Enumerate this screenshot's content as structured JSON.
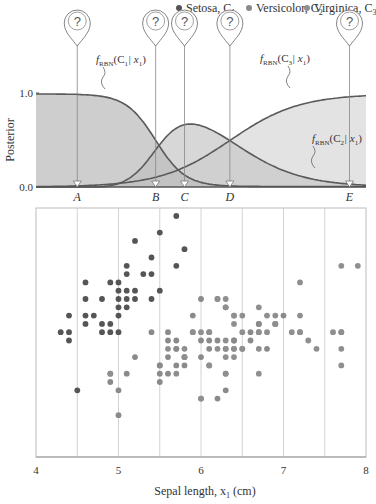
{
  "legend": {
    "items": [
      {
        "label": "Setosa, C",
        "sub": "1",
        "color": "#555555",
        "left": 228
      },
      {
        "label": "Versicolor, C",
        "sub": "2",
        "color": "#8a8a8a",
        "left": 284
      },
      {
        "label": "Virginica, C",
        "sub": "3",
        "color": "#a8a8a8",
        "left": 342
      }
    ]
  },
  "colors": {
    "setosa": "#555555",
    "versicolor": "#8a8a8a",
    "virginica": "#8f8f8f",
    "fill_c1": "#bdbdbd",
    "fill_c2": "#c9c9c9",
    "fill_c3": "#d9d9d9",
    "line": "#5a5a5a",
    "grid": "#c8c8c8"
  },
  "chart_data": [
    {
      "type": "area",
      "title": "",
      "xlabel": "",
      "ylabel": "Posterior",
      "xlim": [
        4,
        8
      ],
      "ylim": [
        0,
        1
      ],
      "yticks": [
        "0.0",
        "1.0"
      ],
      "series": [
        {
          "name": "f_RBN(C1|x1)",
          "label_text": "f(C1 | x1)",
          "x": [
            4.0,
            4.5,
            5.0,
            5.25,
            5.5,
            5.75,
            6.0,
            6.25,
            6.5,
            7.0,
            7.5,
            8.0
          ],
          "values": [
            0.99,
            0.99,
            0.93,
            0.8,
            0.47,
            0.16,
            0.04,
            0.01,
            0.0,
            0.0,
            0.0,
            0.0
          ]
        },
        {
          "name": "f_RBN(C2|x1)",
          "label_text": "f(C2 | x1)",
          "x": [
            4.0,
            4.5,
            5.0,
            5.25,
            5.5,
            5.75,
            6.0,
            6.25,
            6.5,
            7.0,
            7.5,
            8.0
          ],
          "values": [
            0.01,
            0.01,
            0.06,
            0.17,
            0.45,
            0.64,
            0.64,
            0.52,
            0.36,
            0.12,
            0.02,
            0.0
          ]
        },
        {
          "name": "f_RBN(C3|x1)",
          "label_text": "f(C3 | x1)",
          "x": [
            4.0,
            4.5,
            5.0,
            5.25,
            5.5,
            5.75,
            6.0,
            6.25,
            6.5,
            7.0,
            7.5,
            8.0
          ],
          "values": [
            0.0,
            0.0,
            0.01,
            0.03,
            0.08,
            0.2,
            0.32,
            0.47,
            0.64,
            0.88,
            0.97,
            1.0
          ]
        }
      ],
      "markers": [
        {
          "label": "A",
          "x": 4.5
        },
        {
          "label": "B",
          "x": 5.45
        },
        {
          "label": "C",
          "x": 5.8
        },
        {
          "label": "D",
          "x": 6.35
        },
        {
          "label": "E",
          "x": 7.8
        }
      ],
      "marker_icon": "?"
    },
    {
      "type": "scatter",
      "title": "",
      "xlabel": "Sepal length, x1 (cm)",
      "ylabel": "",
      "xlim": [
        4,
        8
      ],
      "xticks": [
        4,
        5,
        6,
        7,
        8
      ],
      "grid_x_step": 0.5,
      "series": [
        {
          "name": "Setosa, C1",
          "points": [
            [
              5.7,
              4.4
            ],
            [
              5.5,
              4.2
            ],
            [
              5.2,
              4.1
            ],
            [
              5.8,
              4.0
            ],
            [
              5.4,
              3.9
            ],
            [
              5.7,
              3.8
            ],
            [
              5.1,
              3.8
            ],
            [
              5.1,
              3.7
            ],
            [
              5.3,
              3.7
            ],
            [
              5.4,
              3.7
            ],
            [
              4.6,
              3.6
            ],
            [
              4.9,
              3.6
            ],
            [
              5.0,
              3.6
            ],
            [
              5.0,
              3.5
            ],
            [
              5.1,
              3.5
            ],
            [
              5.2,
              3.5
            ],
            [
              5.5,
              3.5
            ],
            [
              4.6,
              3.4
            ],
            [
              4.8,
              3.4
            ],
            [
              5.0,
              3.4
            ],
            [
              5.1,
              3.4
            ],
            [
              5.2,
              3.4
            ],
            [
              5.4,
              3.4
            ],
            [
              5.0,
              3.3
            ],
            [
              5.1,
              3.3
            ],
            [
              4.4,
              3.2
            ],
            [
              4.6,
              3.2
            ],
            [
              4.7,
              3.2
            ],
            [
              5.0,
              3.2
            ],
            [
              4.6,
              3.1
            ],
            [
              4.8,
              3.1
            ],
            [
              4.9,
              3.1
            ],
            [
              4.3,
              3.0
            ],
            [
              4.4,
              3.0
            ],
            [
              4.8,
              3.0
            ],
            [
              4.9,
              3.0
            ],
            [
              5.0,
              3.0
            ],
            [
              4.4,
              2.9
            ],
            [
              4.5,
              2.3
            ]
          ]
        },
        {
          "name": "Versicolor, C2",
          "points": [
            [
              7.0,
              3.2
            ],
            [
              6.4,
              3.2
            ],
            [
              6.9,
              3.1
            ],
            [
              6.7,
              3.1
            ],
            [
              6.3,
              3.3
            ],
            [
              6.0,
              3.4
            ],
            [
              6.7,
              3.0
            ],
            [
              6.6,
              3.0
            ],
            [
              6.8,
              2.8
            ],
            [
              6.1,
              3.0
            ],
            [
              5.9,
              3.2
            ],
            [
              5.6,
              3.0
            ],
            [
              5.9,
              3.0
            ],
            [
              6.1,
              2.9
            ],
            [
              6.2,
              2.9
            ],
            [
              6.4,
              2.9
            ],
            [
              6.6,
              2.9
            ],
            [
              6.0,
              2.9
            ],
            [
              5.7,
              2.9
            ],
            [
              5.6,
              2.9
            ],
            [
              5.4,
              3.0
            ],
            [
              5.7,
              2.8
            ],
            [
              6.1,
              2.8
            ],
            [
              6.3,
              2.5
            ],
            [
              5.8,
              2.7
            ],
            [
              6.0,
              2.7
            ],
            [
              5.6,
              2.7
            ],
            [
              5.8,
              2.6
            ],
            [
              5.5,
              2.6
            ],
            [
              5.7,
              2.6
            ],
            [
              5.2,
              2.7
            ],
            [
              5.5,
              2.5
            ],
            [
              5.5,
              2.4
            ],
            [
              4.9,
              2.4
            ],
            [
              5.0,
              2.3
            ],
            [
              5.1,
              2.5
            ],
            [
              4.9,
              2.5
            ],
            [
              5.0,
              2.0
            ],
            [
              6.3,
              2.3
            ],
            [
              6.2,
              2.2
            ],
            [
              6.0,
              2.2
            ],
            [
              6.7,
              3.1
            ],
            [
              5.6,
              2.5
            ],
            [
              6.1,
              2.6
            ],
            [
              5.7,
              2.8
            ],
            [
              6.4,
              2.9
            ],
            [
              6.5,
              2.8
            ],
            [
              6.3,
              2.8
            ],
            [
              5.8,
              2.7
            ],
            [
              5.5,
              2.6
            ]
          ]
        },
        {
          "name": "Virginica, C3",
          "points": [
            [
              7.7,
              3.8
            ],
            [
              7.9,
              3.8
            ],
            [
              7.2,
              3.6
            ],
            [
              6.7,
              3.3
            ],
            [
              6.3,
              3.3
            ],
            [
              6.2,
              3.4
            ],
            [
              6.4,
              3.1
            ],
            [
              6.5,
              3.2
            ],
            [
              6.9,
              3.1
            ],
            [
              6.8,
              3.2
            ],
            [
              6.7,
              3.0
            ],
            [
              7.2,
              3.2
            ],
            [
              7.1,
              3.0
            ],
            [
              7.2,
              3.0
            ],
            [
              7.6,
              3.0
            ],
            [
              7.7,
              3.0
            ],
            [
              6.5,
              3.0
            ],
            [
              6.4,
              3.2
            ],
            [
              6.3,
              2.9
            ],
            [
              6.8,
              3.0
            ],
            [
              6.1,
              3.0
            ],
            [
              6.2,
              3.4
            ],
            [
              5.9,
              3.0
            ],
            [
              6.0,
              3.0
            ],
            [
              6.3,
              2.7
            ],
            [
              6.4,
              2.7
            ],
            [
              6.4,
              2.8
            ],
            [
              6.5,
              2.8
            ],
            [
              6.7,
              2.8
            ],
            [
              7.3,
              2.9
            ],
            [
              7.4,
              2.8
            ],
            [
              7.7,
              2.8
            ],
            [
              7.7,
              2.6
            ],
            [
              6.3,
              2.5
            ],
            [
              6.9,
              3.1
            ],
            [
              7.2,
              3.0
            ],
            [
              6.3,
              2.8
            ],
            [
              6.1,
              2.6
            ],
            [
              6.0,
              2.2
            ],
            [
              6.7,
              2.5
            ],
            [
              5.8,
              2.7
            ],
            [
              5.8,
              2.8
            ],
            [
              5.6,
              2.8
            ],
            [
              5.7,
              2.5
            ],
            [
              4.9,
              2.5
            ],
            [
              6.2,
              2.8
            ],
            [
              7.7,
              3.0
            ],
            [
              6.3,
              3.4
            ],
            [
              6.4,
              2.8
            ],
            [
              6.9,
              3.2
            ]
          ]
        }
      ]
    }
  ],
  "axes": {
    "top_ylabel": "Posterior",
    "top_y0": "0.0",
    "top_y1": "1.0",
    "bottom_xlabel": "Sepal length, x",
    "bottom_xlabel_sub": "1",
    "bottom_xlabel_unit": " (cm)",
    "xticks": [
      "4",
      "5",
      "6",
      "7",
      "8"
    ]
  },
  "annotations": {
    "c1": {
      "f": "f",
      "sub": "RBN",
      "arg": "(C",
      "argsub": "1",
      "tail": "| x",
      "tailsub": "1",
      "close": ")"
    },
    "c2": {
      "f": "f",
      "sub": "RBN",
      "arg": "(C",
      "argsub": "2",
      "tail": "| x",
      "tailsub": "1",
      "close": ")"
    },
    "c3": {
      "f": "f",
      "sub": "RBN",
      "arg": "(C",
      "argsub": "3",
      "tail": "| x",
      "tailsub": "1",
      "close": ")"
    }
  }
}
